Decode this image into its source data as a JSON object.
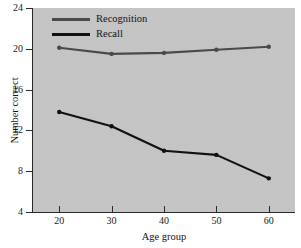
{
  "chart_data": {
    "type": "line",
    "title": "",
    "xlabel": "Age group",
    "ylabel": "Number correct",
    "x": [
      20,
      30,
      40,
      50,
      60
    ],
    "xtick_labels": [
      "20",
      "30",
      "40",
      "50",
      "60"
    ],
    "ytick_labels": [
      "4",
      "8",
      "12",
      "16",
      "20",
      "24"
    ],
    "yticks": [
      4,
      8,
      12,
      16,
      20,
      24
    ],
    "xlim": [
      15,
      65
    ],
    "ylim": [
      4,
      24
    ],
    "grid": false,
    "legend_position": "upper-left-inside",
    "plot_background": "#c9c9c9",
    "page_background": "#ffffff",
    "series": [
      {
        "name": "Recognition",
        "color": "#4a4a4a",
        "values": [
          20.1,
          19.5,
          19.6,
          19.9,
          20.2
        ]
      },
      {
        "name": "Recall",
        "color": "#111111",
        "values": [
          13.8,
          12.4,
          10.0,
          9.6,
          7.3
        ]
      }
    ]
  },
  "legend": {
    "entries": [
      {
        "label": "Recognition",
        "color": "#4a4a4a"
      },
      {
        "label": "Recall",
        "color": "#111111"
      }
    ]
  }
}
